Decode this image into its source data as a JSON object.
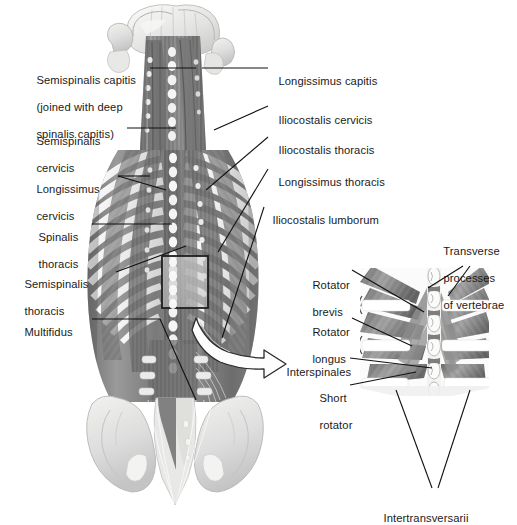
{
  "figure": {
    "background_color": "#ffffff",
    "text_color": "#1a1a1a",
    "style": "grayscale medical illustration"
  },
  "main_view": {
    "name": "posterior-trunk-view",
    "description": "Posterior view of skull base, cervical, thoracic and lumbar spine with rib cage and pelvis showing deep back musculature",
    "highlight_box": {
      "x": 162,
      "y": 256,
      "width": 46,
      "height": 52
    },
    "arrow": {
      "name": "detail-callout-arrow",
      "from": "highlight-box",
      "to": "detail-inset",
      "color": "#ffffff",
      "outline": "#1a1a1a"
    }
  },
  "labels_left": [
    {
      "id": "semispinalis-capitis",
      "lines": [
        "Semispinalis capitis",
        "(joined with deep",
        "spinalis capitis)"
      ],
      "x": 30,
      "y": 61
    },
    {
      "id": "semispinalis-cervicis",
      "lines": [
        "Semispinalis",
        "cervicis"
      ],
      "x": 30,
      "y": 122
    },
    {
      "id": "longissimus-cervicis",
      "lines": [
        "Longissimus",
        "cervicis"
      ],
      "x": 30,
      "y": 170
    },
    {
      "id": "spinalis-thoracis",
      "lines": [
        "Spinalis",
        "thoracis"
      ],
      "x": 32,
      "y": 218
    },
    {
      "id": "semispinalis-thoracis",
      "lines": [
        "Semispinalis",
        "thoracis"
      ],
      "x": 18,
      "y": 265
    },
    {
      "id": "multifidus",
      "lines": [
        "Multifidus"
      ],
      "x": 18,
      "y": 313
    }
  ],
  "labels_right": [
    {
      "id": "longissimus-capitis",
      "lines": [
        "Longissimus capitis"
      ],
      "x": 272,
      "y": 62
    },
    {
      "id": "iliocostalis-cervicis",
      "lines": [
        "Iliocostalis cervicis"
      ],
      "x": 272,
      "y": 101
    },
    {
      "id": "iliocostalis-thoracis",
      "lines": [
        "Iliocostalis thoracis"
      ],
      "x": 272,
      "y": 131
    },
    {
      "id": "longissimus-thoracis",
      "lines": [
        "Longissimus thoracis"
      ],
      "x": 272,
      "y": 163
    },
    {
      "id": "iliocostalis-lumborum",
      "lines": [
        "Iliocostalis lumborum"
      ],
      "x": 266,
      "y": 201
    }
  ],
  "detail_inset": {
    "name": "vertebral-detail-inset",
    "description": "Enlarged detail of thoracic vertebrae showing rotator and interspinal muscles",
    "bounds": {
      "x": 358,
      "y": 268,
      "width": 132,
      "height": 128
    },
    "labels": [
      {
        "id": "transverse-processes-of-vertebrae",
        "lines": [
          "Transverse",
          "processes",
          "of vertebrae"
        ],
        "x": 437,
        "y": 232
      },
      {
        "id": "rotator-brevis",
        "lines": [
          "Rotator",
          "brevis"
        ],
        "x": 306,
        "y": 266
      },
      {
        "id": "rotator-longus",
        "lines": [
          "Rotator",
          "longus"
        ],
        "x": 306,
        "y": 313
      },
      {
        "id": "interspinales",
        "lines": [
          "Interspinales"
        ],
        "x": 280,
        "y": 353
      },
      {
        "id": "short-rotator",
        "lines": [
          "Short",
          "rotator"
        ],
        "x": 313,
        "y": 379
      },
      {
        "id": "intertransversarii",
        "lines": [
          "Intertransversarii"
        ],
        "x": 377,
        "y": 499
      }
    ]
  }
}
